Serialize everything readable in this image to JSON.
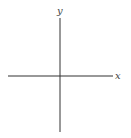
{
  "chart_data": {
    "type": "line",
    "title": "",
    "xlabel": "x",
    "ylabel": "y",
    "xlim": [
      -3.1416,
      3.1416
    ],
    "ylim": [
      -3,
      3
    ],
    "x_ticks": [
      -1,
      1
    ],
    "x_tick_labels": [
      "−1",
      "1"
    ],
    "y_ticks": [
      -2,
      -1,
      1,
      2
    ],
    "y_tick_labels": [
      "−2",
      "−1",
      "",
      "2"
    ],
    "grid": false,
    "legend": null,
    "series": [
      {
        "name": "y = -3 sin x",
        "amplitude": -3,
        "color": "#555555"
      },
      {
        "name": "y = -2 sin x",
        "amplitude": -2,
        "color": "#7a7a7a"
      },
      {
        "name": "y = -sin x",
        "amplitude": -1,
        "color": "#a8a8a8"
      },
      {
        "name": "y = sin x",
        "amplitude": 1,
        "color": "#222222"
      },
      {
        "name": "y = 2 sin x",
        "amplitude": 2,
        "color": "#c4c4c4"
      },
      {
        "name": "y = 3 sin x",
        "amplitude": 3,
        "color": "#dcdcdc"
      }
    ]
  },
  "axes": {
    "x_label": "x",
    "y_label": "y"
  }
}
